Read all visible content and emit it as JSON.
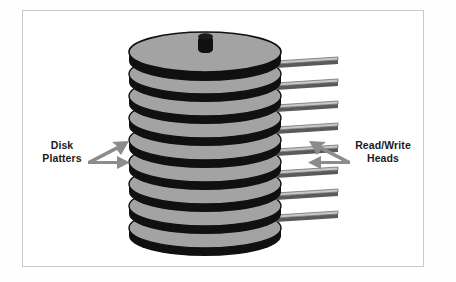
{
  "figure": {
    "name": "disk-platter-stack-diagram",
    "background_color": "#ffffff",
    "frame_color": "#c9c9c9",
    "frame": {
      "x": 22,
      "y": 10,
      "width": 402,
      "height": 257
    }
  },
  "annotations": {
    "left": {
      "name": "disk-platters",
      "line1": "Disk",
      "line2": "Platters",
      "arrow_count": 2,
      "arrow_color": "#8c8c8c",
      "arrow_direction": "right"
    },
    "right": {
      "name": "read-write-heads",
      "line1": "Read/Write",
      "line2": "Heads",
      "arrow_count": 2,
      "arrow_color": "#8c8c8c",
      "arrow_direction": "left"
    }
  },
  "stack": {
    "platter_count": 9,
    "platter_face_color": "#a3a3a3",
    "platter_edge_color": "#101010",
    "spindle_color": "#101010",
    "head_arm_count": 8,
    "head_arm_top_color": "#c0c0c0",
    "head_arm_edge_color": "#5a5a5a",
    "center_x": 205,
    "top_y": 46,
    "bottom_y": 236,
    "radius_x": 76,
    "radius_y": 20
  }
}
